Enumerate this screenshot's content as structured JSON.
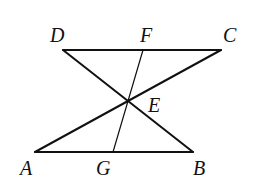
{
  "figure": {
    "points": {
      "A": {
        "label": "A",
        "x": 35,
        "y": 152,
        "lx": 20,
        "ly": 175
      },
      "B": {
        "label": "B",
        "x": 193,
        "y": 152,
        "lx": 193,
        "ly": 175
      },
      "C": {
        "label": "C",
        "x": 221,
        "y": 50,
        "lx": 223,
        "ly": 42
      },
      "D": {
        "label": "D",
        "x": 63,
        "y": 50,
        "lx": 50,
        "ly": 42
      },
      "E": {
        "label": "E",
        "x": 128,
        "y": 100,
        "lx": 148,
        "ly": 112
      },
      "F": {
        "label": "F",
        "x": 143,
        "y": 50,
        "lx": 140,
        "ly": 42
      },
      "G": {
        "label": "G",
        "x": 113,
        "y": 152,
        "lx": 96,
        "ly": 175
      }
    },
    "segments": [
      {
        "name": "DC",
        "from": "D",
        "to": "C"
      },
      {
        "name": "AB",
        "from": "A",
        "to": "B"
      },
      {
        "name": "AC",
        "from": "A",
        "to": "C"
      },
      {
        "name": "DB",
        "from": "D",
        "to": "B"
      },
      {
        "name": "FG",
        "from": "F",
        "to": "G"
      }
    ]
  }
}
